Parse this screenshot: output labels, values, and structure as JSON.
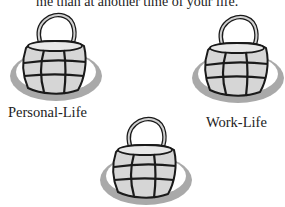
{
  "document": {
    "top_text": "me than at another time of your life."
  },
  "illustrations": [
    {
      "name": "personal-life-basket",
      "label": "Personal-Life"
    },
    {
      "name": "work-life-basket",
      "label": "Work-Life"
    },
    {
      "name": "third-basket",
      "label": ""
    }
  ],
  "colors": {
    "shadow": "#a9a9a9",
    "basket_fill": "#d6d6d6",
    "basket_cell": "#c2c2c2",
    "outline": "#1a1a1a",
    "background": "#ffffff"
  }
}
